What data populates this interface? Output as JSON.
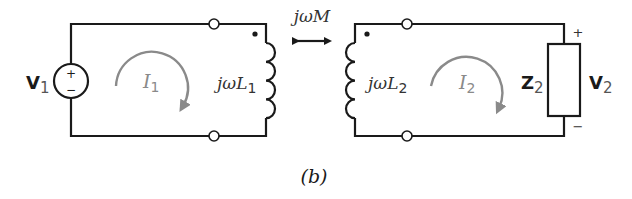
{
  "diagram": {
    "caption": "(b)",
    "coupling": {
      "label_prefix": "jω",
      "label_var": "M"
    },
    "primary": {
      "source": {
        "name": "V",
        "sub": "1",
        "plus": "+",
        "minus": "−"
      },
      "current": {
        "name": "I",
        "sub": "1"
      },
      "inductor": {
        "prefix": "jω",
        "var": "L",
        "sub": "1"
      }
    },
    "secondary": {
      "inductor": {
        "prefix": "jω",
        "var": "L",
        "sub": "2"
      },
      "current": {
        "name": "I",
        "sub": "2"
      },
      "load": {
        "name": "Z",
        "sub": "2"
      },
      "voltage": {
        "name": "V",
        "sub": "2",
        "plus": "+",
        "minus": "−"
      }
    },
    "colors": {
      "wire": "#1a1a1a",
      "loop_arrow": "#8a8a8a",
      "background": "#ffffff"
    }
  }
}
